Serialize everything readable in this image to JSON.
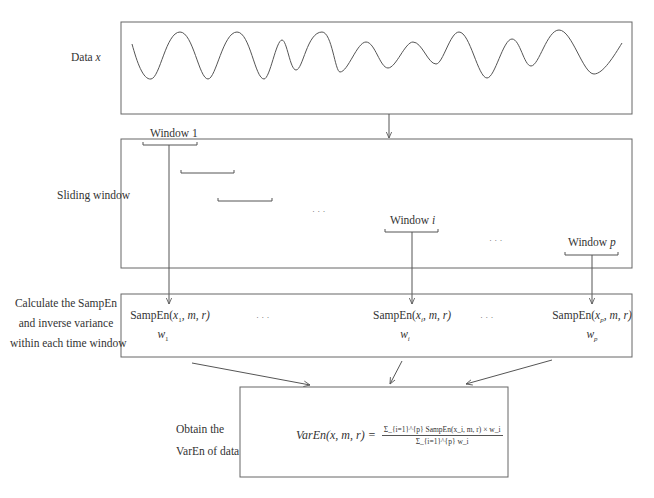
{
  "stages": {
    "data": {
      "label_prefix": "Data ",
      "label_var": "x"
    },
    "sliding": {
      "label": "Sliding window",
      "window_first": {
        "prefix": "Window ",
        "index": "1"
      },
      "window_mid": {
        "prefix": "Window ",
        "index": "i"
      },
      "window_last": {
        "prefix": "Window ",
        "index": "p"
      },
      "ellipsis": "· · ·"
    },
    "calculate": {
      "label_lines": [
        "Calculate the SampEn",
        "and inverse variance",
        "within each time window"
      ],
      "cells": [
        {
          "func": "SampEn(",
          "arg": "x",
          "sub": "1",
          "rest": ", m, r)",
          "weight": "w",
          "weight_sub": "1"
        },
        {
          "func": "SampEn(",
          "arg": "x",
          "sub": "i",
          "rest": ", m, r)",
          "weight": "w",
          "weight_sub": "i"
        },
        {
          "func": "SampEn(",
          "arg": "x",
          "sub": "p",
          "rest": ", m, r)",
          "weight": "w",
          "weight_sub": "p"
        }
      ],
      "ellipsis": "· · ·"
    },
    "obtain": {
      "label_lines": [
        "Obtain the",
        "VarEn of data"
      ],
      "formula_lhs": "VarEn(x, m, r) =",
      "formula_num": "Σ_{i=1}^{p} SampEn(x_i, m, r) × w_i",
      "formula_den": "Σ_{i=1}^{p} w_i"
    }
  },
  "colors": {
    "line": "#555555",
    "text": "#333333",
    "background": "#ffffff"
  }
}
